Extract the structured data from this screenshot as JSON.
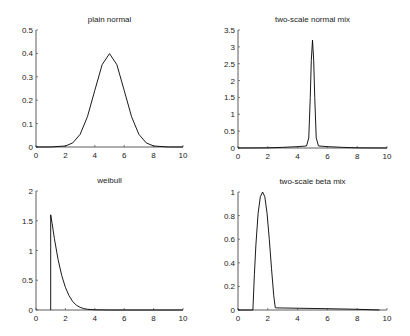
{
  "figure": {
    "width": 410,
    "height": 336,
    "background": "#ffffff",
    "line_color": "#000000",
    "axis_color": "#333333"
  },
  "chart_data": [
    {
      "type": "line",
      "title": "plain normal",
      "xlabel": "",
      "ylabel": "",
      "xlim": [
        0,
        10
      ],
      "ylim": [
        0,
        0.5
      ],
      "xticks": [
        0,
        2,
        4,
        6,
        8,
        10
      ],
      "xtick_labels": [
        "0",
        "2",
        "4",
        "6",
        "8",
        "10"
      ],
      "yticks": [
        0,
        0.1,
        0.2,
        0.3,
        0.4,
        0.5
      ],
      "ytick_labels": [
        "0",
        "0.1",
        "0.2",
        "0.3",
        "0.4",
        "0.5"
      ],
      "grid": false,
      "distribution": {
        "kind": "normal",
        "mean": 5,
        "sd": 1
      },
      "series": [
        {
          "name": "density",
          "x": [
            0,
            1,
            2,
            2.5,
            3,
            3.5,
            4,
            4.5,
            5,
            5.5,
            6,
            6.5,
            7,
            7.5,
            8,
            9,
            10
          ],
          "y": [
            0,
            0.0001,
            0.0044,
            0.0175,
            0.054,
            0.1295,
            0.242,
            0.352,
            0.399,
            0.352,
            0.242,
            0.1295,
            0.054,
            0.0175,
            0.0044,
            0.0001,
            0
          ]
        }
      ],
      "box": {
        "left": 36,
        "right": 183,
        "top": 30,
        "bottom": 147
      }
    },
    {
      "type": "line",
      "title": "two-scale normal mix",
      "xlabel": "",
      "ylabel": "",
      "xlim": [
        0,
        10
      ],
      "ylim": [
        0,
        3.5
      ],
      "xticks": [
        0,
        2,
        4,
        6,
        8,
        10
      ],
      "xtick_labels": [
        "0",
        "2",
        "4",
        "6",
        "8",
        "10"
      ],
      "yticks": [
        0,
        0.5,
        1,
        1.5,
        2,
        2.5,
        3,
        3.5
      ],
      "ytick_labels": [
        "0",
        "0.5",
        "1",
        "1.5",
        "2",
        "2.5",
        "3",
        "3.5"
      ],
      "grid": false,
      "distribution": {
        "kind": "normal mixture",
        "center": 5,
        "peak": 3.2
      },
      "series": [
        {
          "name": "density",
          "x": [
            0,
            2,
            3,
            4,
            4.6,
            4.75,
            4.85,
            4.92,
            5.0,
            5.08,
            5.15,
            5.25,
            5.4,
            6,
            7,
            8,
            10
          ],
          "y": [
            0,
            0.005,
            0.02,
            0.04,
            0.06,
            0.3,
            1.5,
            2.6,
            3.2,
            2.6,
            1.5,
            0.3,
            0.06,
            0.04,
            0.02,
            0.005,
            0
          ]
        }
      ],
      "box": {
        "left": 238,
        "right": 387,
        "top": 30,
        "bottom": 148
      }
    },
    {
      "type": "line",
      "title": "weibull",
      "xlabel": "",
      "ylabel": "",
      "xlim": [
        0,
        10
      ],
      "ylim": [
        0,
        2
      ],
      "xticks": [
        0,
        2,
        4,
        6,
        8,
        10
      ],
      "xtick_labels": [
        "0",
        "2",
        "4",
        "6",
        "8",
        "10"
      ],
      "yticks": [
        0,
        0.5,
        1,
        1.5,
        2
      ],
      "ytick_labels": [
        "0",
        "0.5",
        "1",
        "1.5",
        "2"
      ],
      "grid": false,
      "distribution": {
        "kind": "shifted weibull",
        "location": 1,
        "peak": 1.6
      },
      "series": [
        {
          "name": "density",
          "x": [
            1,
            1,
            1.1,
            1.25,
            1.5,
            1.75,
            2,
            2.25,
            2.5,
            2.75,
            3,
            3.25,
            3.5,
            4,
            5,
            10
          ],
          "y": [
            0,
            1.6,
            1.45,
            1.2,
            0.85,
            0.58,
            0.38,
            0.24,
            0.14,
            0.08,
            0.045,
            0.024,
            0.012,
            0.003,
            0,
            0
          ]
        }
      ],
      "box": {
        "left": 36,
        "right": 183,
        "top": 191,
        "bottom": 310
      }
    },
    {
      "type": "line",
      "title": "two-scale beta mix",
      "xlabel": "",
      "ylabel": "",
      "xlim": [
        0,
        10
      ],
      "ylim": [
        0,
        1
      ],
      "xticks": [
        0,
        2,
        4,
        6,
        8,
        10
      ],
      "xtick_labels": [
        "0",
        "2",
        "4",
        "6",
        "8",
        "10"
      ],
      "yticks": [
        0,
        0.2,
        0.4,
        0.6,
        0.8,
        1
      ],
      "ytick_labels": [
        "0",
        "0.2",
        "0.4",
        "0.6",
        "0.8",
        "1"
      ],
      "grid": false,
      "distribution": {
        "kind": "beta mixture",
        "support_start": 1,
        "peak_x": 1.65,
        "peak": 1.0
      },
      "series": [
        {
          "name": "density",
          "x": [
            0,
            1,
            1.1,
            1.2,
            1.35,
            1.5,
            1.65,
            1.8,
            1.95,
            2.1,
            2.25,
            2.4,
            2.5,
            2.55,
            4,
            6,
            8,
            9,
            9.5
          ],
          "y": [
            0,
            0,
            0.3,
            0.55,
            0.82,
            0.96,
            1.0,
            0.96,
            0.82,
            0.6,
            0.35,
            0.12,
            0.02,
            0.018,
            0.015,
            0.011,
            0.006,
            0.002,
            0
          ]
        }
      ],
      "box": {
        "left": 238,
        "right": 387,
        "top": 192,
        "bottom": 310
      }
    }
  ]
}
